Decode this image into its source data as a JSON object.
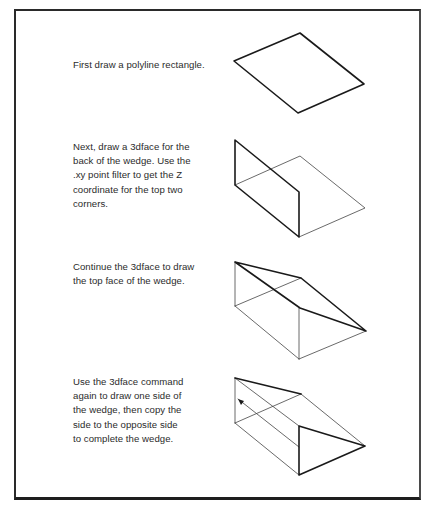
{
  "page": {
    "type": "instructional-diagram"
  },
  "steps": [
    {
      "index": 1,
      "text": "First draw a polyline rectangle.",
      "lines": [
        "First draw a polyline rectangle."
      ],
      "figure": "polyline-rectangle"
    },
    {
      "index": 2,
      "text": "Next, draw a 3dface for the back of the wedge. Use the .xy point filter to get the Z coordinate for the top two corners.",
      "lines": [
        "Next, draw a 3dface for the",
        "back of the wedge. Use the",
        ".xy point filter to get the Z",
        "coordinate for the top two",
        "corners."
      ],
      "figure": "back-face"
    },
    {
      "index": 3,
      "text": "Continue the 3dface to draw the top face of the wedge.",
      "lines": [
        "Continue the 3dface to draw",
        "the top face of the wedge."
      ],
      "figure": "top-face"
    },
    {
      "index": 4,
      "text": "Use the 3dface command again to draw one side of the wedge, then copy the side to the opposite side to complete the wedge.",
      "lines": [
        "Use the 3dface command",
        "again to draw one side of",
        "the wedge, then copy the",
        "side to the opposite side",
        "to complete the wedge."
      ],
      "figure": "completed-wedge"
    }
  ],
  "colors": {
    "background": "#ffffff",
    "frame": "#2a2a2a",
    "text": "#2b2b2b",
    "line_thin": "#444444",
    "line_thick": "#1a1a1a"
  }
}
